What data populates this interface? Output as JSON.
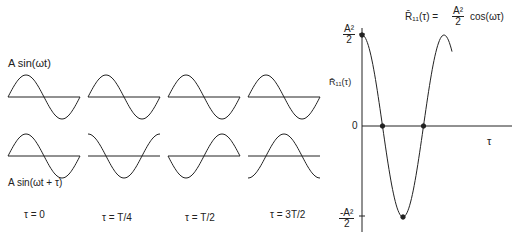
{
  "left_panel": {
    "top_row_label": "A sin(ωt)",
    "bottom_row_label": "A sin(ωt + τ)",
    "columns": [
      {
        "label": "τ = 0",
        "shift_fraction": 0.0
      },
      {
        "label": "τ = T/4",
        "shift_fraction": 0.25
      },
      {
        "label": "τ = T/2",
        "shift_fraction": 0.5
      },
      {
        "label": "τ = 3T/2",
        "shift_fraction": 0.75
      }
    ]
  },
  "right_panel": {
    "title_lhs": "R̄₁₁(τ) =",
    "title_num": "A²",
    "title_den": "2",
    "title_rhs": "cos(ωτ)",
    "y_axis_label": "R̄₁₁(τ)",
    "x_axis_label": "τ",
    "y_tick_top_num": "A²",
    "y_tick_top_den": "2",
    "y_tick_zero": "0",
    "y_tick_bottom_num": "-A²",
    "y_tick_bottom_den": "2"
  },
  "colors": {
    "line": "#222222",
    "background": "#ffffff"
  }
}
